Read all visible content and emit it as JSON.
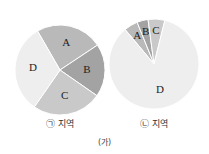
{
  "figure_label": "(가)",
  "colors": {
    "A": "#b9b9b9",
    "B": "#a3a3a3",
    "C": "#c9c9c9",
    "D": "#eeeeee",
    "separator": "#ffffff"
  },
  "chart_data": [
    {
      "type": "pie",
      "title": "㉠ 지역",
      "categories": [
        "A",
        "B",
        "C",
        "D"
      ],
      "values": [
        24,
        19,
        25,
        32
      ],
      "start_angle_deg": -30,
      "legend": "none (labels inside slices)"
    },
    {
      "type": "pie",
      "title": "㉡ 지역",
      "categories": [
        "A",
        "B",
        "C",
        "D"
      ],
      "values": [
        5,
        4,
        6,
        85
      ],
      "start_angle_deg": -40,
      "legend": "none (labels inside slices)"
    }
  ]
}
